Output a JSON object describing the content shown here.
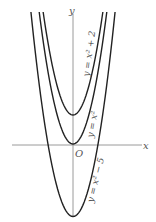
{
  "chart_data": {
    "type": "line",
    "title": "",
    "xlabel": "x",
    "ylabel": "y",
    "origin_label": "O",
    "grid": false,
    "legend": "inline labels along curves",
    "xlim": [
      -5,
      6
    ],
    "ylim": [
      -6,
      9
    ],
    "series": [
      {
        "name": "y = x² + 2",
        "label": "y = x² + 2",
        "a": 1,
        "c": 2,
        "vertex": [
          0,
          2
        ]
      },
      {
        "name": "y = x²",
        "label": "y = x²",
        "a": 1,
        "c": 0,
        "vertex": [
          0,
          0
        ]
      },
      {
        "name": "y = x² − 5",
        "label": "y = x² − 5",
        "a": 1,
        "c": -5,
        "vertex": [
          0,
          -5
        ]
      }
    ]
  },
  "colors": {
    "curve": "#222222",
    "axis": "#999999",
    "label": "#555555",
    "background": "#ffffff"
  },
  "labels": {
    "x_axis": "x",
    "y_axis": "y",
    "origin": "O",
    "curve1": "y = x² + 2",
    "curve2": "y = x²",
    "curve3": "y = x² − 5"
  }
}
